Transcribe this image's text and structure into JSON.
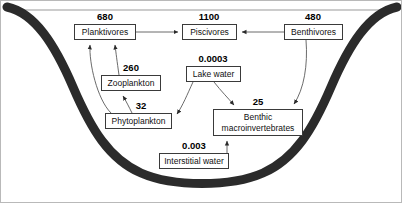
{
  "figure": {
    "background_color": "#ffffff",
    "border_color": "#b9b9b9",
    "basin_fill_color": "#2b2b2b",
    "water_surface_color": "#9a9a9a",
    "box_border_color": "#3a3a3a",
    "text_color": "#111111"
  },
  "nodes": [
    {
      "id": "planktivores",
      "label": "Planktivores",
      "value": "680",
      "x": 73,
      "y": 23,
      "w": 62,
      "h": 16,
      "value_x": 104,
      "value_y": 10
    },
    {
      "id": "piscivores",
      "label": "Piscivores",
      "value": "1100",
      "x": 181,
      "y": 23,
      "w": 55,
      "h": 16,
      "value_x": 208,
      "value_y": 10
    },
    {
      "id": "benthivores",
      "label": "Benthivores",
      "value": "480",
      "x": 283,
      "y": 23,
      "w": 59,
      "h": 16,
      "value_x": 312,
      "value_y": 10
    },
    {
      "id": "zooplankton",
      "label": "Zooplankton",
      "value": "260",
      "x": 100,
      "y": 74,
      "w": 60,
      "h": 16,
      "value_x": 130,
      "value_y": 61
    },
    {
      "id": "lake-water",
      "label": "Lake water",
      "value": "0.0003",
      "x": 185,
      "y": 65,
      "w": 55,
      "h": 16,
      "value_x": 212,
      "value_y": 52
    },
    {
      "id": "phytoplankton",
      "label": "Phytoplankton",
      "value": "32",
      "x": 104,
      "y": 112,
      "w": 67,
      "h": 16,
      "value_x": 140,
      "value_y": 99
    },
    {
      "id": "benthic-macroinvertebrates",
      "label_line1": "Benthic",
      "label_line2": "macroinvertebrates",
      "value": "25",
      "x": 212,
      "y": 108,
      "w": 90,
      "h": 27,
      "value_x": 257,
      "value_y": 95
    },
    {
      "id": "interstitial-water",
      "label": "Interstitial water",
      "value": "0.003",
      "x": 158,
      "y": 152,
      "w": 70,
      "h": 16,
      "value_x": 193,
      "value_y": 139
    }
  ],
  "edges": [
    {
      "id": "planktivores-to-piscivores",
      "from": "planktivores",
      "to": "piscivores"
    },
    {
      "id": "benthivores-to-piscivores",
      "from": "benthivores",
      "to": "piscivores"
    },
    {
      "id": "zooplankton-to-planktivores",
      "from": "zooplankton",
      "to": "planktivores"
    },
    {
      "id": "phytoplankton-to-planktivores",
      "from": "phytoplankton",
      "to": "planktivores"
    },
    {
      "id": "phytoplankton-to-zooplankton",
      "from": "phytoplankton",
      "to": "zooplankton"
    },
    {
      "id": "lake-water-to-phytoplankton",
      "from": "lake-water",
      "to": "phytoplankton"
    },
    {
      "id": "lake-water-to-benthic-macroinvertebrates",
      "from": "lake-water",
      "to": "benthic-macroinvertebrates"
    },
    {
      "id": "benthivores-to-benthic-macroinvertebrates",
      "from": "benthivores",
      "to": "benthic-macroinvertebrates"
    },
    {
      "id": "interstitial-water-to-benthic-macroinvertebrates",
      "from": "interstitial-water",
      "to": "benthic-macroinvertebrates"
    }
  ]
}
